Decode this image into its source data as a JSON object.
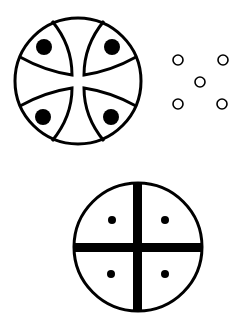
{
  "figures": [
    {
      "id": "ornate-cross-circle",
      "description": "Circle divided by four curved arcs forming a cross, with a filled dot in each of four pointed-lobe regions",
      "center": [
        78,
        81
      ],
      "radius": 63,
      "dots": [
        [
          44,
          47
        ],
        [
          112,
          47
        ],
        [
          43,
          117
        ],
        [
          111,
          117
        ]
      ],
      "dot_radius": 8,
      "dot_fill": "#000000"
    },
    {
      "id": "quincunx-small-circles",
      "description": "Five small hollow circles in a quincunx arrangement",
      "circles": [
        [
          178,
          60
        ],
        [
          223,
          60
        ],
        [
          200,
          82
        ],
        [
          178,
          104
        ],
        [
          222,
          104
        ]
      ],
      "circle_radius": 5
    },
    {
      "id": "quartered-circle",
      "description": "Circle divided into four quadrants by a thick cross, with a small dot in each quadrant",
      "center": [
        138,
        247
      ],
      "radius": 64,
      "dots": [
        [
          112,
          220
        ],
        [
          165,
          220
        ],
        [
          111,
          274
        ],
        [
          165,
          274
        ]
      ],
      "dot_radius": 4
    }
  ],
  "colors": {
    "stroke": "#000000",
    "background": "#ffffff"
  }
}
